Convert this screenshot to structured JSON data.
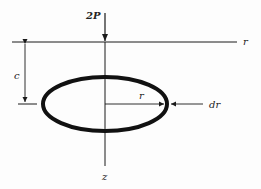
{
  "diagram": {
    "labels": {
      "load": "2P",
      "horizontal_axis": "r",
      "vertical_axis": "z",
      "depth": "c",
      "radius": "r",
      "thickness": "dr"
    },
    "colors": {
      "stroke": "#1a1a1a",
      "background": "#fdfdfd"
    },
    "geometry": {
      "axis_x": 105,
      "surface_y": 42,
      "ring_center_y": 104,
      "ring_rx": 62,
      "ring_ry": 27
    }
  }
}
